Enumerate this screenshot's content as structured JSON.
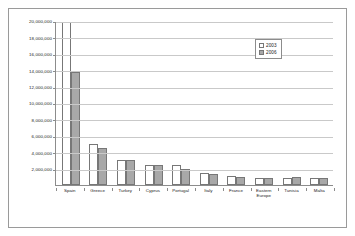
{
  "figure": {
    "background_color": "#ffffff",
    "border_color": "#9a9a9a",
    "gridline_color": "#c9c9c9",
    "axis_color": "#8c8c8c"
  },
  "legend": {
    "position": "top-right-inside",
    "entries": [
      {
        "label": "2003",
        "color": "#ffffff",
        "swatch_name": "legend-swatch-2003"
      },
      {
        "label": "2006",
        "color": "#a8a8a8",
        "swatch_name": "legend-swatch-2006"
      }
    ]
  },
  "chart_data": {
    "type": "bar",
    "title": "",
    "xlabel": "",
    "ylabel": "",
    "ylim": [
      0,
      20000000
    ],
    "grid": true,
    "legend_position": "top-right",
    "categories": [
      "Spain",
      "Greece",
      "Turkey",
      "Cyprus",
      "Portugal",
      "Italy",
      "France",
      "Eastern\nEurope",
      "Tunisia",
      "Malta"
    ],
    "tick_labels": [
      "20,000,000",
      "18,000,000",
      "16,000,000",
      "14,000,000",
      "12,000,000",
      "10,000,000",
      "8,000,000",
      "6,000,000",
      "4,000,000",
      "2,000,000"
    ],
    "tick_values": [
      20000000,
      18000000,
      16000000,
      14000000,
      12000000,
      10000000,
      8000000,
      6000000,
      4000000,
      2000000
    ],
    "series": [
      {
        "name": "2003",
        "color": "#ffffff",
        "values": [
          19900000,
          5000000,
          3000000,
          2500000,
          2400000,
          1500000,
          1100000,
          800000,
          900000,
          800000
        ]
      },
      {
        "name": "2006",
        "color": "#a8a8a8",
        "values": [
          13800000,
          4500000,
          3000000,
          2400000,
          1900000,
          1400000,
          1000000,
          900000,
          1000000,
          800000
        ]
      }
    ]
  }
}
